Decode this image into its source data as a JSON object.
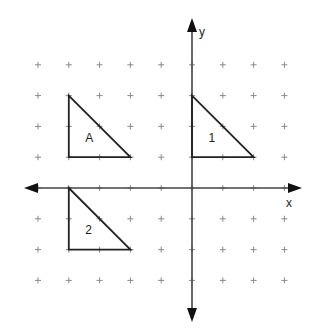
{
  "diagram": {
    "type": "coordinate-grid",
    "axes": {
      "x_label": "x",
      "y_label": "y"
    },
    "grid": {
      "x_range": [
        -5,
        3
      ],
      "y_range": [
        -3,
        4
      ]
    },
    "shapes": [
      {
        "label": "A",
        "vertices": [
          [
            -4,
            3
          ],
          [
            -4,
            1
          ],
          [
            -2,
            1
          ]
        ]
      },
      {
        "label": "1",
        "vertices": [
          [
            0,
            3
          ],
          [
            0,
            1
          ],
          [
            2,
            1
          ]
        ]
      },
      {
        "label": "2",
        "vertices": [
          [
            -4,
            0
          ],
          [
            -4,
            -2
          ],
          [
            -2,
            -2
          ]
        ]
      }
    ]
  }
}
